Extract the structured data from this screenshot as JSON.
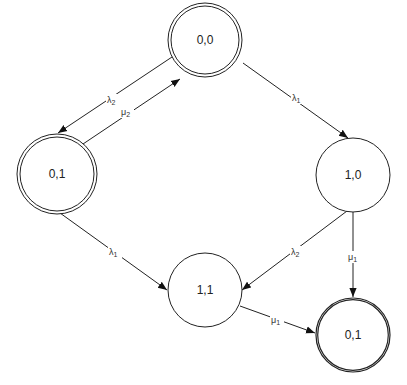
{
  "diagram": {
    "type": "state-transition-diagram",
    "colors": {
      "stroke": "#222222",
      "background": "#ffffff",
      "text": "#222222"
    },
    "nodes": [
      {
        "id": "n00",
        "label": "0,0",
        "cx": 205,
        "cy": 40,
        "r": 37,
        "double": true
      },
      {
        "id": "n01_left",
        "label": "0,1",
        "cx": 57,
        "cy": 174,
        "r": 40,
        "double": true
      },
      {
        "id": "n10",
        "label": "1,0",
        "cx": 353,
        "cy": 175,
        "r": 37,
        "double": false
      },
      {
        "id": "n11",
        "label": "1,1",
        "cx": 205,
        "cy": 290,
        "r": 37,
        "double": false
      },
      {
        "id": "n01_right",
        "label": "0,1",
        "cx": 353,
        "cy": 335,
        "r": 37,
        "double": true
      }
    ],
    "edges": [
      {
        "from": "0,0",
        "to": "0,1 (left)",
        "label": "λ2",
        "base": "λ",
        "sub": "2"
      },
      {
        "from": "0,1 (left)",
        "to": "0,0",
        "label": "μ2",
        "base": "μ",
        "sub": "2"
      },
      {
        "from": "0,0",
        "to": "1,0",
        "label": "λ1",
        "base": "λ",
        "sub": "1"
      },
      {
        "from": "0,1 (left)",
        "to": "1,1",
        "label": "λ1",
        "base": "λ",
        "sub": "1"
      },
      {
        "from": "1,0",
        "to": "1,1",
        "label": "λ2",
        "base": "λ",
        "sub": "2"
      },
      {
        "from": "1,0",
        "to": "0,1 (right)",
        "label": "μ1",
        "base": "μ",
        "sub": "1"
      },
      {
        "from": "1,1",
        "to": "0,1 (right)",
        "label": "μ1",
        "base": "μ",
        "sub": "1"
      }
    ]
  }
}
